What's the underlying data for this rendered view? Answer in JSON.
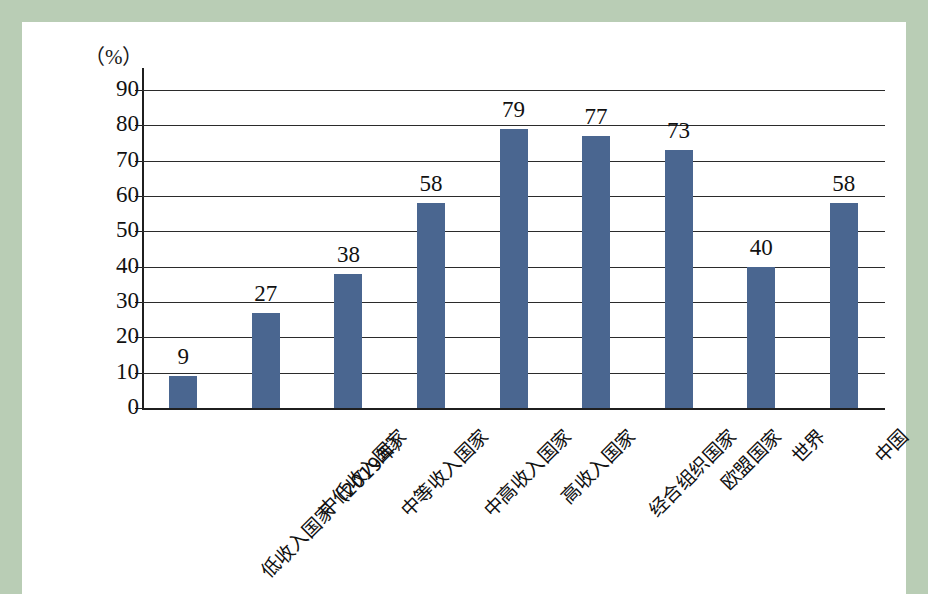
{
  "page": {
    "border_color": "#b9cdb5",
    "background": "#ffffff"
  },
  "chart_data": {
    "type": "bar",
    "title": "",
    "subtitle": "",
    "unit_label": "（%）",
    "xlabel": "",
    "ylabel": "",
    "ylim": [
      0,
      90
    ],
    "ytick_step": 10,
    "grid": true,
    "legend": "none",
    "bar_color": "#4a6690",
    "categories": [
      "低收入国家（2019年）",
      "中低收入国家",
      "中等收入国家",
      "中高收入国家",
      "高收入国家",
      "经合组织国家",
      "欧盟国家",
      "世界",
      "中国"
    ],
    "values": [
      9,
      27,
      38,
      58,
      79,
      77,
      73,
      40,
      58
    ],
    "value_labels": [
      "9",
      "27",
      "38",
      "58",
      "79",
      "77",
      "73",
      "40",
      "58"
    ],
    "ytick_labels": [
      "90",
      "80",
      "70",
      "60",
      "50",
      "40",
      "30",
      "20",
      "10",
      "0"
    ],
    "yticks": [
      90,
      80,
      70,
      60,
      50,
      40,
      30,
      20,
      10,
      0
    ]
  }
}
